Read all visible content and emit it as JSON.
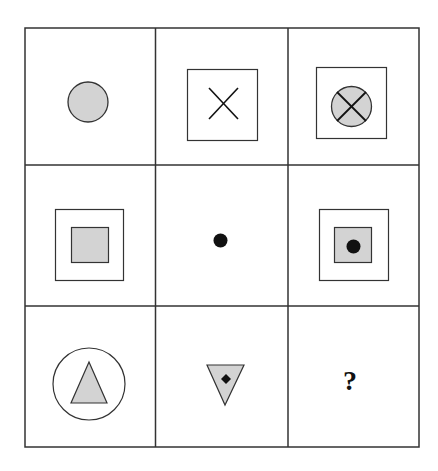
{
  "puzzle": {
    "type": "3x3 figure matrix",
    "colors": {
      "fill": "#d3d3d3",
      "stroke": "#333333",
      "solid": "#111111",
      "background": "#ffffff"
    },
    "cells": [
      {
        "row": 1,
        "col": 1,
        "figure": "gray circle"
      },
      {
        "row": 1,
        "col": 2,
        "figure": "X inside square"
      },
      {
        "row": 1,
        "col": 3,
        "figure": "gray circle with X inside square"
      },
      {
        "row": 2,
        "col": 1,
        "figure": "gray square inside square"
      },
      {
        "row": 2,
        "col": 2,
        "figure": "black dot"
      },
      {
        "row": 2,
        "col": 3,
        "figure": "black dot in gray square inside square"
      },
      {
        "row": 3,
        "col": 1,
        "figure": "gray triangle inside circle"
      },
      {
        "row": 3,
        "col": 2,
        "figure": "black diamond in gray inverted triangle"
      },
      {
        "row": 3,
        "col": 3,
        "figure": "question mark",
        "label": "?"
      }
    ],
    "answer_placeholder": "?"
  }
}
